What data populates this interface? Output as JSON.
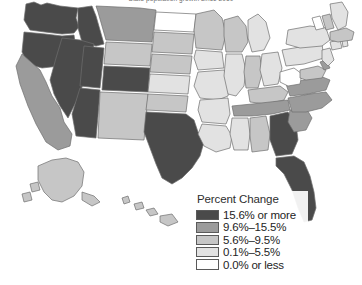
{
  "figure": {
    "title": "State population growth since 2010",
    "background_color": "#ffffff",
    "border_color": "#6e6e6e"
  },
  "legend": {
    "title": "Percent Change",
    "items": [
      {
        "label": "15.6% or more",
        "color": "#4a4a4a"
      },
      {
        "label": "9.6%–15.5%",
        "color": "#9b9b9b"
      },
      {
        "label": "5.6%–9.5%",
        "color": "#c6c6c6"
      },
      {
        "label": "0.1%–5.5%",
        "color": "#e2e2e2"
      },
      {
        "label": "0.0% or less",
        "color": "#ffffff"
      }
    ]
  },
  "chart_data": {
    "type": "heatmap",
    "title": "State population growth since 2010",
    "xlabel": "",
    "ylabel": "",
    "legend_position": "bottom-right",
    "grid": false,
    "value_label": "Percent Change",
    "bins": [
      {
        "id": "b5",
        "label": "15.6% or more",
        "color": "#4a4a4a",
        "min": 15.6,
        "max": null
      },
      {
        "id": "b4",
        "label": "9.6%–15.5%",
        "color": "#9b9b9b",
        "min": 9.6,
        "max": 15.5
      },
      {
        "id": "b3",
        "label": "5.6%–9.5%",
        "color": "#c6c6c6",
        "min": 5.6,
        "max": 9.5
      },
      {
        "id": "b2",
        "label": "0.1%–5.5%",
        "color": "#e2e2e2",
        "min": 0.1,
        "max": 5.5
      },
      {
        "id": "b1",
        "label": "0.0% or less",
        "color": "#ffffff",
        "min": null,
        "max": 0.0
      }
    ],
    "categories": [
      "WA",
      "OR",
      "ID",
      "NV",
      "UT",
      "CA",
      "AZ",
      "MT",
      "WY",
      "CO",
      "NM",
      "ND",
      "SD",
      "NE",
      "KS",
      "OK",
      "TX",
      "MN",
      "IA",
      "MO",
      "AR",
      "LA",
      "WI",
      "IL",
      "MI",
      "IN",
      "OH",
      "KY",
      "TN",
      "MS",
      "AL",
      "GA",
      "FL",
      "SC",
      "NC",
      "VA",
      "WV",
      "MD",
      "DE",
      "PA",
      "NJ",
      "NY",
      "CT",
      "RI",
      "MA",
      "VT",
      "NH",
      "ME",
      "AK",
      "HI"
    ],
    "values": [
      {
        "state": "WA",
        "name": "Washington",
        "bin": "b5"
      },
      {
        "state": "OR",
        "name": "Oregon",
        "bin": "b5"
      },
      {
        "state": "ID",
        "name": "Idaho",
        "bin": "b5"
      },
      {
        "state": "NV",
        "name": "Nevada",
        "bin": "b5"
      },
      {
        "state": "UT",
        "name": "Utah",
        "bin": "b5"
      },
      {
        "state": "CA",
        "name": "California",
        "bin": "b4"
      },
      {
        "state": "AZ",
        "name": "Arizona",
        "bin": "b5"
      },
      {
        "state": "MT",
        "name": "Montana",
        "bin": "b4"
      },
      {
        "state": "WY",
        "name": "Wyoming",
        "bin": "b3"
      },
      {
        "state": "CO",
        "name": "Colorado",
        "bin": "b5"
      },
      {
        "state": "NM",
        "name": "New Mexico",
        "bin": "b3"
      },
      {
        "state": "ND",
        "name": "North Dakota",
        "bin": "b1"
      },
      {
        "state": "SD",
        "name": "South Dakota",
        "bin": "b3"
      },
      {
        "state": "NE",
        "name": "Nebraska",
        "bin": "b3"
      },
      {
        "state": "KS",
        "name": "Kansas",
        "bin": "b2"
      },
      {
        "state": "OK",
        "name": "Oklahoma",
        "bin": "b3"
      },
      {
        "state": "TX",
        "name": "Texas",
        "bin": "b5"
      },
      {
        "state": "MN",
        "name": "Minnesota",
        "bin": "b3"
      },
      {
        "state": "IA",
        "name": "Iowa",
        "bin": "b2"
      },
      {
        "state": "MO",
        "name": "Missouri",
        "bin": "b2"
      },
      {
        "state": "AR",
        "name": "Arkansas",
        "bin": "b2"
      },
      {
        "state": "LA",
        "name": "Louisiana",
        "bin": "b2"
      },
      {
        "state": "WI",
        "name": "Wisconsin",
        "bin": "b3"
      },
      {
        "state": "IL",
        "name": "Illinois",
        "bin": "b2"
      },
      {
        "state": "MI",
        "name": "Michigan",
        "bin": "b2"
      },
      {
        "state": "IN",
        "name": "Indiana",
        "bin": "b3"
      },
      {
        "state": "OH",
        "name": "Ohio",
        "bin": "b2"
      },
      {
        "state": "KY",
        "name": "Kentucky",
        "bin": "b3"
      },
      {
        "state": "TN",
        "name": "Tennessee",
        "bin": "b4"
      },
      {
        "state": "MS",
        "name": "Mississippi",
        "bin": "b2"
      },
      {
        "state": "AL",
        "name": "Alabama",
        "bin": "b3"
      },
      {
        "state": "GA",
        "name": "Georgia",
        "bin": "b5"
      },
      {
        "state": "FL",
        "name": "Florida",
        "bin": "b5"
      },
      {
        "state": "SC",
        "name": "South Carolina",
        "bin": "b4"
      },
      {
        "state": "NC",
        "name": "North Carolina",
        "bin": "b4"
      },
      {
        "state": "VA",
        "name": "Virginia",
        "bin": "b4"
      },
      {
        "state": "WV",
        "name": "West Virginia",
        "bin": "b1"
      },
      {
        "state": "MD",
        "name": "Maryland",
        "bin": "b3"
      },
      {
        "state": "DE",
        "name": "Delaware",
        "bin": "b4"
      },
      {
        "state": "PA",
        "name": "Pennsylvania",
        "bin": "b2"
      },
      {
        "state": "NJ",
        "name": "New Jersey",
        "bin": "b2"
      },
      {
        "state": "NY",
        "name": "New York",
        "bin": "b2"
      },
      {
        "state": "CT",
        "name": "Connecticut",
        "bin": "b2"
      },
      {
        "state": "RI",
        "name": "Rhode Island",
        "bin": "b2"
      },
      {
        "state": "MA",
        "name": "Massachusetts",
        "bin": "b3"
      },
      {
        "state": "VT",
        "name": "Vermont",
        "bin": "b1"
      },
      {
        "state": "NH",
        "name": "New Hampshire",
        "bin": "b3"
      },
      {
        "state": "ME",
        "name": "Maine",
        "bin": "b2"
      },
      {
        "state": "AK",
        "name": "Alaska",
        "bin": "b3"
      },
      {
        "state": "HI",
        "name": "Hawaii",
        "bin": "b3"
      }
    ]
  }
}
